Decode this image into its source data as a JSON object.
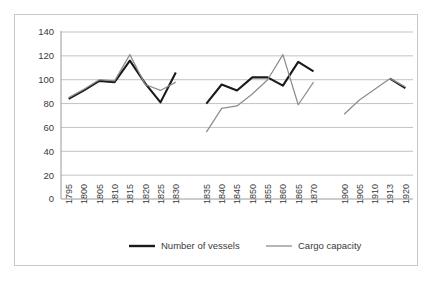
{
  "chart_data": {
    "type": "line",
    "title": "",
    "subtitle": "",
    "xlabel": "",
    "ylabel": "",
    "ylim": [
      0,
      140
    ],
    "yticks": [
      0,
      20,
      40,
      60,
      80,
      100,
      120,
      140
    ],
    "grid": true,
    "legend_position": "bottom",
    "categories": [
      "1795",
      "1800",
      "1805",
      "1810",
      "1815",
      "1820",
      "1825",
      "1830",
      "",
      "1835",
      "1840",
      "1845",
      "1850",
      "1855",
      "1860",
      "1865",
      "1870",
      "",
      "1900",
      "1905",
      "1910",
      "1913",
      "1920"
    ],
    "series": [
      {
        "name": "Number of vessels",
        "color": "#1a1a1a",
        "values": [
          84,
          91,
          99,
          98,
          116,
          97,
          81,
          106,
          null,
          80,
          96,
          91,
          102,
          102,
          95,
          115,
          107,
          null,
          null,
          null,
          null,
          101,
          93
        ]
      },
      {
        "name": "Cargo capacity",
        "color": "#8d8d8d",
        "values": [
          85,
          92,
          100,
          99,
          121,
          96,
          91,
          98,
          null,
          56,
          76,
          78,
          88,
          100,
          121,
          79,
          98,
          null,
          71,
          83,
          92,
          101,
          94
        ]
      }
    ]
  },
  "legend": {
    "items": [
      {
        "label": "Number of vessels"
      },
      {
        "label": "Cargo capacity"
      }
    ]
  },
  "colors": {
    "vessels": "#1a1a1a",
    "cargo": "#8d8d8d",
    "grid": "#b3b3b3",
    "frame": "#c9c9c9",
    "text": "#3a3a3a",
    "background": "#ffffff"
  }
}
